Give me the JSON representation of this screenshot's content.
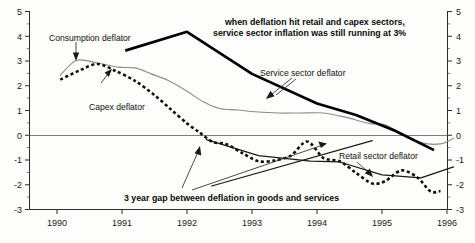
{
  "chart_data": {
    "type": "line",
    "title": "",
    "subtitle": "",
    "xlabel": "",
    "ylabel": "",
    "xlim": [
      1989.92,
      1996.25
    ],
    "ylim": [
      -3,
      5
    ],
    "yticks": [
      -3,
      -2,
      -1,
      0,
      1,
      2,
      3,
      4,
      5
    ],
    "ytick_labels": [
      "-3",
      "-2",
      "-1",
      "0",
      "1",
      "2",
      "3",
      "4",
      "5"
    ],
    "xticks": [
      1990,
      1991,
      1992,
      1993,
      1994,
      1995,
      1996
    ],
    "xtick_labels": [
      "1990",
      "1991",
      "1992",
      "1993",
      "1994",
      "1995",
      "1996"
    ],
    "grid": false,
    "legend_position": "inline-labels",
    "dual_y_axis": true,
    "zero_reference_line": 0,
    "series": [
      {
        "name": "Consumption deflator",
        "style": "thin-grey-solid",
        "color": "#8d8d8d",
        "x": [
          1990.05,
          1990.3,
          1990.62,
          1990.95,
          1991.2,
          1991.45,
          1991.72,
          1992.0,
          1992.25,
          1992.5,
          1992.78,
          1993.05,
          1993.4,
          1993.75,
          1994.1,
          1994.45,
          1994.8,
          1995.05,
          1995.3,
          1995.6,
          1995.9,
          1996.1
        ],
        "y": [
          2.42,
          3.03,
          2.92,
          2.75,
          2.72,
          2.48,
          2.2,
          1.78,
          1.35,
          1.08,
          1.02,
          0.95,
          0.9,
          0.9,
          0.9,
          0.72,
          0.48,
          0.42,
          0.05,
          -0.3,
          -0.35,
          -0.12
        ]
      },
      {
        "name": "Capex deflator",
        "style": "bold-dotted",
        "color": "#111111",
        "x": [
          1990.05,
          1990.35,
          1990.62,
          1990.9,
          1991.2,
          1991.5,
          1991.75,
          1992.0,
          1992.2,
          1992.4,
          1992.6,
          1992.85,
          1993.1,
          1993.35,
          1993.6,
          1993.85,
          1994.1,
          1994.35,
          1994.6,
          1994.85,
          1995.05,
          1995.3,
          1995.55,
          1995.75,
          1995.9
        ],
        "y": [
          2.25,
          2.62,
          2.88,
          2.6,
          2.2,
          1.62,
          1.05,
          0.48,
          0.1,
          -0.28,
          -0.35,
          -0.72,
          -1.05,
          -1.02,
          -0.82,
          -0.25,
          -0.92,
          -1.05,
          -1.52,
          -1.95,
          -1.85,
          -1.42,
          -1.72,
          -2.28,
          -2.25
        ]
      },
      {
        "name": "Service sector deflator",
        "style": "bold-solid",
        "color": "#000000",
        "x": [
          1991.05,
          1992.0,
          1993.0,
          1994.0,
          1994.6,
          1995.2,
          1995.8
        ],
        "y": [
          3.42,
          4.18,
          2.48,
          1.28,
          0.82,
          0.18,
          -0.6
        ]
      },
      {
        "name": "Retail sector deflator",
        "style": "thin-solid",
        "color": "#1a1a1a",
        "x": [
          1992.3,
          1993.1,
          1993.9,
          1994.35,
          1995.0,
          1995.6,
          1996.1
        ],
        "y": [
          -0.18,
          -0.82,
          -1.05,
          -1.08,
          -1.6,
          -1.72,
          -1.28
        ]
      },
      {
        "name": "three-year-gap-guide",
        "style": "thin-solid-guide",
        "color": "#1a1a1a",
        "x": [
          1992.38,
          1994.85
        ],
        "y": [
          -2.05,
          -0.22
        ]
      }
    ],
    "annotations": [
      {
        "name": "headline",
        "lines": [
          "when deflation hit retail and capex sectors,",
          "service sector inflation was still running at 3%"
        ],
        "style": "bold"
      },
      {
        "name": "three-year-gap",
        "lines": [
          "3 year gap between deflation in goods and services"
        ],
        "style": "bold"
      },
      {
        "name": "consumption-label",
        "lines": [
          "Consumption deflator"
        ],
        "style": "plain"
      },
      {
        "name": "capex-label",
        "lines": [
          "Capex deflator"
        ],
        "style": "plain"
      },
      {
        "name": "service-label",
        "lines": [
          "Service sector deflator"
        ],
        "style": "plain"
      },
      {
        "name": "retail-label",
        "lines": [
          "Retail sector deflator"
        ],
        "style": "plain"
      }
    ]
  },
  "labels": {
    "consumption": "Consumption deflator",
    "capex": "Capex deflator",
    "service": "Service sector deflator",
    "retail": "Retail sector deflator",
    "headline_line1": "when deflation hit retail and capex sectors,",
    "headline_line2": "service sector inflation was still running at 3%",
    "gap_note": "3 year gap between deflation in goods and services"
  },
  "axis": {
    "y_left": [
      "5",
      "4",
      "3",
      "2",
      "1",
      "0",
      "-1",
      "-2",
      "-3"
    ],
    "y_right": [
      "5",
      "4",
      "3",
      "2",
      "1",
      "0",
      "-1",
      "-2",
      "-3"
    ],
    "x": [
      "1990",
      "1991",
      "1992",
      "1993",
      "1994",
      "1995",
      "1996"
    ]
  },
  "colors": {
    "background": "#fdfdfc",
    "axis": "#2b2b2b",
    "zero_line": "#7d7d7d",
    "consumption": "#8d8d8d",
    "capex": "#111111",
    "service": "#000000",
    "retail": "#1a1a1a"
  }
}
